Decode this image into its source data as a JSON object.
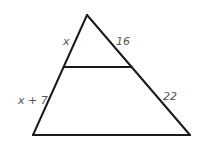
{
  "diagram": {
    "type": "triangle-with-parallel-segment",
    "colors": {
      "stroke": "#1a1a1a",
      "label": "#555555",
      "background": "#ffffff"
    },
    "vertices": {
      "apex": [
        87,
        15
      ],
      "bottom_left": [
        33,
        135
      ],
      "bottom_right": [
        190,
        135
      ]
    },
    "transversal": {
      "left": [
        64,
        67
      ],
      "right": [
        132,
        67
      ]
    },
    "labels": {
      "left_upper": "x",
      "right_upper": "16",
      "left_lower": "x + 7",
      "right_lower": "22"
    }
  }
}
